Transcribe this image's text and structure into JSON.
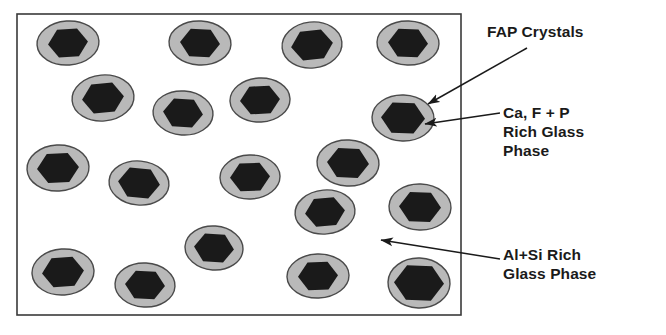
{
  "figure": {
    "kind": "schematic-microstructure-diagram",
    "background_color": "#ffffff",
    "matrix_box": {
      "name": "glass-ceramic-matrix",
      "x": 17,
      "y": 14,
      "width": 444,
      "height": 301,
      "fill": "#ffffff",
      "stroke": "#3a3a3a",
      "stroke_width": 1.6
    },
    "colors": {
      "crystal_fill": "#1a1a1a",
      "halo_fill": "#b9b9b9",
      "halo_stroke": "#4a4a4a",
      "matrix_fill": "#ffffff",
      "outline": "#3a3a3a",
      "text": "#1a1a1a",
      "leader_line": "#1a1a1a"
    }
  },
  "labels": [
    {
      "id": "fap",
      "name": "fap-crystals-label",
      "lines": [
        "FAP Crystals"
      ],
      "text": "FAP Crystals",
      "points_to": "crystal_fill"
    },
    {
      "id": "cafp",
      "name": "ca-f-p-rich-glass-phase-label",
      "lines": [
        "Ca, F + P",
        "Rich Glass",
        "Phase"
      ],
      "text": "Ca, F + P\nRich Glass\nPhase",
      "points_to": "halo_fill"
    },
    {
      "id": "alsi",
      "name": "al-si-rich-glass-phase-label",
      "lines": [
        "Al+Si Rich",
        "Glass Phase"
      ],
      "text": "Al+Si Rich\nGlass Phase",
      "points_to": "matrix_fill"
    }
  ],
  "leaders": [
    {
      "name": "leader-fap-crystals",
      "from_x": 527,
      "from_y": 48,
      "to_x": 428,
      "to_y": 104,
      "arrow": true
    },
    {
      "name": "leader-ca-f-p-rich-glass",
      "from_x": 500,
      "from_y": 113,
      "to_x": 425,
      "to_y": 124,
      "arrow": true
    },
    {
      "name": "leader-al-si-rich-glass",
      "from_x": 500,
      "from_y": 259,
      "to_x": 381,
      "to_y": 240,
      "arrow": true
    }
  ],
  "particles": [
    {
      "name": "particle-r1-c1",
      "cx": 68,
      "cy": 43,
      "rx": 31,
      "ry": 22,
      "hex_r": 20,
      "rot": -4
    },
    {
      "name": "particle-r1-c2",
      "cx": 200,
      "cy": 43,
      "rx": 31,
      "ry": 22,
      "hex_r": 20,
      "rot": 3
    },
    {
      "name": "particle-r1-c3",
      "cx": 312,
      "cy": 45,
      "rx": 30,
      "ry": 23,
      "hex_r": 21,
      "rot": -6
    },
    {
      "name": "particle-r1-c4",
      "cx": 408,
      "cy": 43,
      "rx": 31,
      "ry": 22,
      "hex_r": 20,
      "rot": 2
    },
    {
      "name": "particle-r2-c1",
      "cx": 103,
      "cy": 98,
      "rx": 31,
      "ry": 23,
      "hex_r": 21,
      "rot": -5
    },
    {
      "name": "particle-r2-c2",
      "cx": 183,
      "cy": 113,
      "rx": 30,
      "ry": 22,
      "hex_r": 20,
      "rot": 4
    },
    {
      "name": "particle-r2-c3",
      "cx": 260,
      "cy": 100,
      "rx": 30,
      "ry": 22,
      "hex_r": 20,
      "rot": -3
    },
    {
      "name": "particle-r2-c4",
      "cx": 403,
      "cy": 118,
      "rx": 31,
      "ry": 23,
      "hex_r": 22,
      "rot": 2
    },
    {
      "name": "particle-r3-c1",
      "cx": 58,
      "cy": 168,
      "rx": 31,
      "ry": 23,
      "hex_r": 21,
      "rot": -3
    },
    {
      "name": "particle-r3-c2",
      "cx": 139,
      "cy": 183,
      "rx": 30,
      "ry": 22,
      "hex_r": 21,
      "rot": 5
    },
    {
      "name": "particle-r3-c3",
      "cx": 250,
      "cy": 177,
      "rx": 30,
      "ry": 22,
      "hex_r": 20,
      "rot": -2
    },
    {
      "name": "particle-r3-c4",
      "cx": 348,
      "cy": 163,
      "rx": 31,
      "ry": 23,
      "hex_r": 21,
      "rot": 3
    },
    {
      "name": "particle-r4-c1",
      "cx": 325,
      "cy": 212,
      "rx": 30,
      "ry": 22,
      "hex_r": 20,
      "rot": -5
    },
    {
      "name": "particle-r4-c2",
      "cx": 420,
      "cy": 207,
      "rx": 31,
      "ry": 23,
      "hex_r": 21,
      "rot": 2
    },
    {
      "name": "particle-r5-c1",
      "cx": 214,
      "cy": 248,
      "rx": 29,
      "ry": 22,
      "hex_r": 20,
      "rot": 4
    },
    {
      "name": "particle-r5-c2",
      "cx": 63,
      "cy": 272,
      "rx": 31,
      "ry": 23,
      "hex_r": 21,
      "rot": -4
    },
    {
      "name": "particle-r5-c3",
      "cx": 145,
      "cy": 285,
      "rx": 30,
      "ry": 22,
      "hex_r": 20,
      "rot": 3
    },
    {
      "name": "particle-r5-c4",
      "cx": 318,
      "cy": 276,
      "rx": 31,
      "ry": 22,
      "hex_r": 20,
      "rot": -2
    },
    {
      "name": "particle-r5-c5",
      "cx": 419,
      "cy": 283,
      "rx": 31,
      "ry": 25,
      "hex_r": 25,
      "rot": 2
    }
  ]
}
